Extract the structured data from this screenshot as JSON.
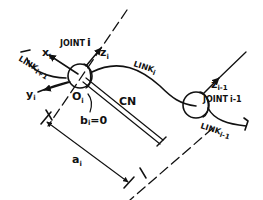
{
  "diagram": {
    "title": "",
    "joint_i": {
      "label": "JOINT",
      "index": "i",
      "origin_label": "O",
      "origin_index": "i",
      "x_axis_label": "x",
      "x_axis_index": "i",
      "y_axis_label": "y",
      "y_axis_index": "i",
      "z_axis_label": "z",
      "z_axis_index": "i"
    },
    "joint_i_minus_1": {
      "label": "JOINT",
      "index": "i-1",
      "z_axis_label": "z",
      "z_axis_index": "i-1"
    },
    "links": {
      "link_i": {
        "label": "LINK",
        "index": "i"
      },
      "link_i_plus_1": {
        "label": "LINK",
        "index": "i+1"
      },
      "link_i_minus_1": {
        "label": "LINK",
        "index": "i-1"
      }
    },
    "common_normal": {
      "label": "CN"
    },
    "offset": {
      "label": "b",
      "index": "i",
      "value": "=0"
    },
    "link_length": {
      "label": "a",
      "index": "i"
    }
  }
}
